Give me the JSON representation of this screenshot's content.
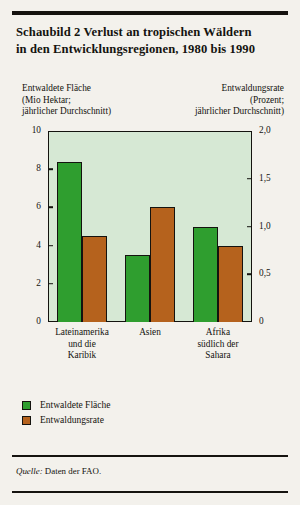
{
  "figure": {
    "title_line1": "Schaubild 2   Verlust an tropischen Wäldern",
    "title_line2": "in den Entwicklungsregionen, 1980 bis 1990",
    "source": "Quelle:",
    "source_text": " Daten der FAO."
  },
  "captions": {
    "left_l1": "Entwaldete Fläche",
    "left_l2": "(Mio Hektar;",
    "left_l3": "jährlicher Durchschnitt)",
    "right_l1": "Entwaldungsrate",
    "right_l2": "(Prozent;",
    "right_l3": "jährlicher Durchschnitt)"
  },
  "legend": {
    "items": [
      {
        "label": "Entwaldete Fläche",
        "color": "#2f9e2f"
      },
      {
        "label": "Entwaldungsrate",
        "color": "#b5621d"
      }
    ]
  },
  "chart_data": {
    "type": "bar",
    "title": "Schaubild 2   Verlust an tropischen Wäldern in den Entwicklungsregionen, 1980 bis 1990",
    "xlabel": "",
    "ylabel": "Entwaldete Fläche (Mio Hektar; jährlicher Durchschnitt)",
    "y2label": "Entwaldungsrate (Prozent; jährlicher Durchschnitt)",
    "categories": [
      "Lateinamerika und die Karibik",
      "Asien",
      "Afrika südlich der Sahara"
    ],
    "category_lines": [
      [
        "Lateinamerika",
        "und die",
        "Karibik"
      ],
      [
        "Asien",
        "",
        ""
      ],
      [
        "Afrika",
        "südlich der",
        "Sahara"
      ]
    ],
    "series": [
      {
        "name": "Entwaldete Fläche",
        "axis": "left",
        "unit": "Mio Hektar",
        "color": "#2f9e2f",
        "values": [
          8.4,
          3.5,
          5.0
        ]
      },
      {
        "name": "Entwaldungsrate",
        "axis": "right",
        "unit": "Prozent",
        "color": "#b5621d",
        "values": [
          0.9,
          1.2,
          0.8
        ]
      }
    ],
    "ylim": [
      0,
      10
    ],
    "y2lim": [
      0,
      2.0
    ],
    "yticks": [
      0,
      2,
      4,
      6,
      8,
      10
    ],
    "ytick_labels": [
      "0",
      "2",
      "4",
      "6",
      "8",
      "10"
    ],
    "y2ticks": [
      0,
      0.5,
      1.0,
      1.5,
      2.0
    ],
    "y2tick_labels": [
      "0",
      "0,5",
      "1,0",
      "1,5",
      "2,0"
    ],
    "grid": false,
    "legend_position": "below-left",
    "plot_background": "#d6e8d4"
  }
}
